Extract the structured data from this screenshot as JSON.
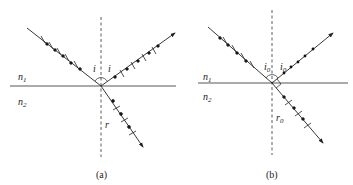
{
  "figure": {
    "panels": [
      {
        "id": "a",
        "caption": "(a)",
        "medium_upper": "n",
        "medium_upper_sub": "1",
        "medium_lower": "n",
        "medium_lower_sub": "2",
        "incident_angle_label": "i",
        "reflected_angle_label": "i",
        "refracted_angle_label": "r",
        "description": "General incidence: incident and reflected rays carry both dot (perpendicular) and bar (parallel) polarization marks; refracted ray is partially polarized"
      },
      {
        "id": "b",
        "caption": "(b)",
        "medium_upper": "n",
        "medium_upper_sub": "1",
        "medium_lower": "n",
        "medium_lower_sub": "2",
        "incident_angle_label": "i",
        "incident_angle_sub": "0",
        "reflected_angle_label": "i",
        "reflected_angle_sub": "0",
        "refracted_angle_label": "r",
        "refracted_angle_sub": "0",
        "description": "Brewster angle incidence: reflected ray carries only dots (fully polarized), reflected and refracted rays are perpendicular (right-angle mark)"
      }
    ]
  }
}
